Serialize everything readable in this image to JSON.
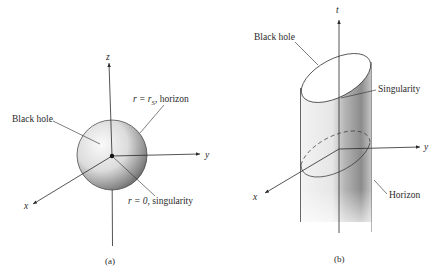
{
  "figure_a": {
    "caption": "(a)",
    "axes": {
      "z": "z",
      "y": "y",
      "x": "x"
    },
    "labels": {
      "black_hole": "Black hole",
      "horizon_r": "r = r",
      "horizon_sub": "S",
      "horizon_text": ", horizon",
      "singularity_r": "r = 0",
      "singularity_text": ", singularity"
    }
  },
  "figure_b": {
    "caption": "(b)",
    "axes": {
      "t": "t",
      "y": "y",
      "x": "x"
    },
    "labels": {
      "black_hole": "Black hole",
      "singularity": "Singularity",
      "horizon": "Horizon"
    }
  },
  "colors": {
    "line": "#2a2a2a",
    "sphere_light": "#f4f4f4",
    "sphere_dark": "#6e6e6e",
    "background": "#ffffff"
  }
}
